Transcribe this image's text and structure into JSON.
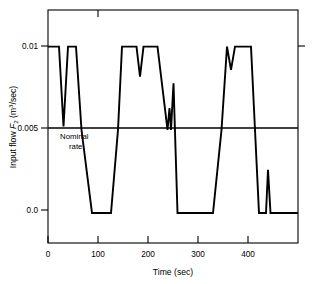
{
  "chart_data": {
    "type": "line",
    "title": "",
    "xlabel": "Time (sec)",
    "ylabel_parts": {
      "lead": "Input flow ",
      "symbol": "F",
      "symbol_sub": "2",
      "units_open": " (m",
      "units_sup": "3",
      "units_close": "/sec)"
    },
    "ylabel": "Input flow F2 (m3/sec)",
    "xlim": [
      0,
      500
    ],
    "ylim": [
      -0.0018,
      0.0122
    ],
    "xticks": [
      0,
      100,
      200,
      300,
      400
    ],
    "xticklabels": [
      "0",
      "100",
      "200",
      "300",
      "400"
    ],
    "yticks": [
      0.0,
      0.005,
      0.01
    ],
    "yticklabels": [
      "0.0",
      "0.005",
      "0.01"
    ],
    "grid": false,
    "legend": "none",
    "annotations": [
      {
        "name": "nominal-rate",
        "line1": "Nominal",
        "line2": "rate",
        "y_value": 0.005,
        "x_text": 70
      }
    ],
    "reference_lines": [
      {
        "name": "nominal-rate-line",
        "orientation": "horizontal",
        "value": 0.005
      }
    ],
    "series": [
      {
        "name": "input-flow-F2",
        "x": [
          0,
          52,
          90,
          123,
          152,
          167,
          200,
          210,
          228,
          243,
          252,
          290,
          302,
          335,
          344,
          352,
          380,
          390,
          400,
          412,
          424,
          438,
          450,
          480,
          493,
          500,
          510,
          520,
          545,
          557,
          600,
          615,
          627,
          640,
          660,
          672,
          680,
          700,
          715,
          730,
          750,
          770,
          790,
          805,
          818,
          830,
          860,
          880,
          900,
          920,
          940,
          960,
          980,
          1000
        ],
        "y": [
          0.01,
          0.01,
          0.0052,
          0.01,
          0.01,
          0.0,
          0.0,
          0.01,
          0.01,
          0.0082,
          0.01,
          0.01,
          0.0,
          0.0,
          0.005,
          0.0078,
          0.0,
          0.0,
          0.01,
          0.0086,
          0.01,
          0.01,
          0.0,
          0.0,
          0.0026,
          0.0,
          0.0,
          0.0,
          0.0,
          0.0,
          0.0,
          0.0,
          0.0,
          0.0,
          0.0,
          0.0,
          0.0,
          0.0,
          0.0,
          0.0,
          0.0,
          0.0,
          0.0,
          0.0,
          0.0,
          0.0,
          0.0,
          0.0,
          0.0,
          0.0,
          0.0,
          0.0,
          0.0,
          0.0
        ],
        "points": [
          [
            0,
            0.01
          ],
          [
            22,
            0.01
          ],
          [
            31,
            0.0052
          ],
          [
            40,
            0.01
          ],
          [
            56,
            0.01
          ],
          [
            67,
            0.005
          ],
          [
            88,
            0.0
          ],
          [
            106,
            0.0
          ],
          [
            126,
            0.0
          ],
          [
            140,
            0.005
          ],
          [
            148,
            0.01
          ],
          [
            177,
            0.01
          ],
          [
            184,
            0.0082
          ],
          [
            191,
            0.01
          ],
          [
            219,
            0.01
          ],
          [
            239,
            0.005
          ],
          [
            243,
            0.0063
          ],
          [
            246,
            0.005
          ],
          [
            251,
            0.0078
          ],
          [
            259,
            0.0
          ],
          [
            277,
            0.0
          ],
          [
            330,
            0.0
          ],
          [
            347,
            0.005
          ],
          [
            358,
            0.01
          ],
          [
            366,
            0.0086
          ],
          [
            374,
            0.01
          ],
          [
            406,
            0.01
          ],
          [
            414,
            0.005
          ],
          [
            422,
            0.0
          ],
          [
            436,
            0.0
          ],
          [
            440,
            0.0026
          ],
          [
            445,
            0.0
          ],
          [
            452,
            0.0
          ],
          [
            500,
            0.0
          ]
        ],
        "color": "#000000",
        "linewidth": 1.9
      }
    ]
  },
  "figure": {
    "background_color": "#ffffff",
    "line_color": "#000000",
    "frame": {
      "left": 48,
      "right": 298,
      "top": 10,
      "bottom": 243
    }
  }
}
